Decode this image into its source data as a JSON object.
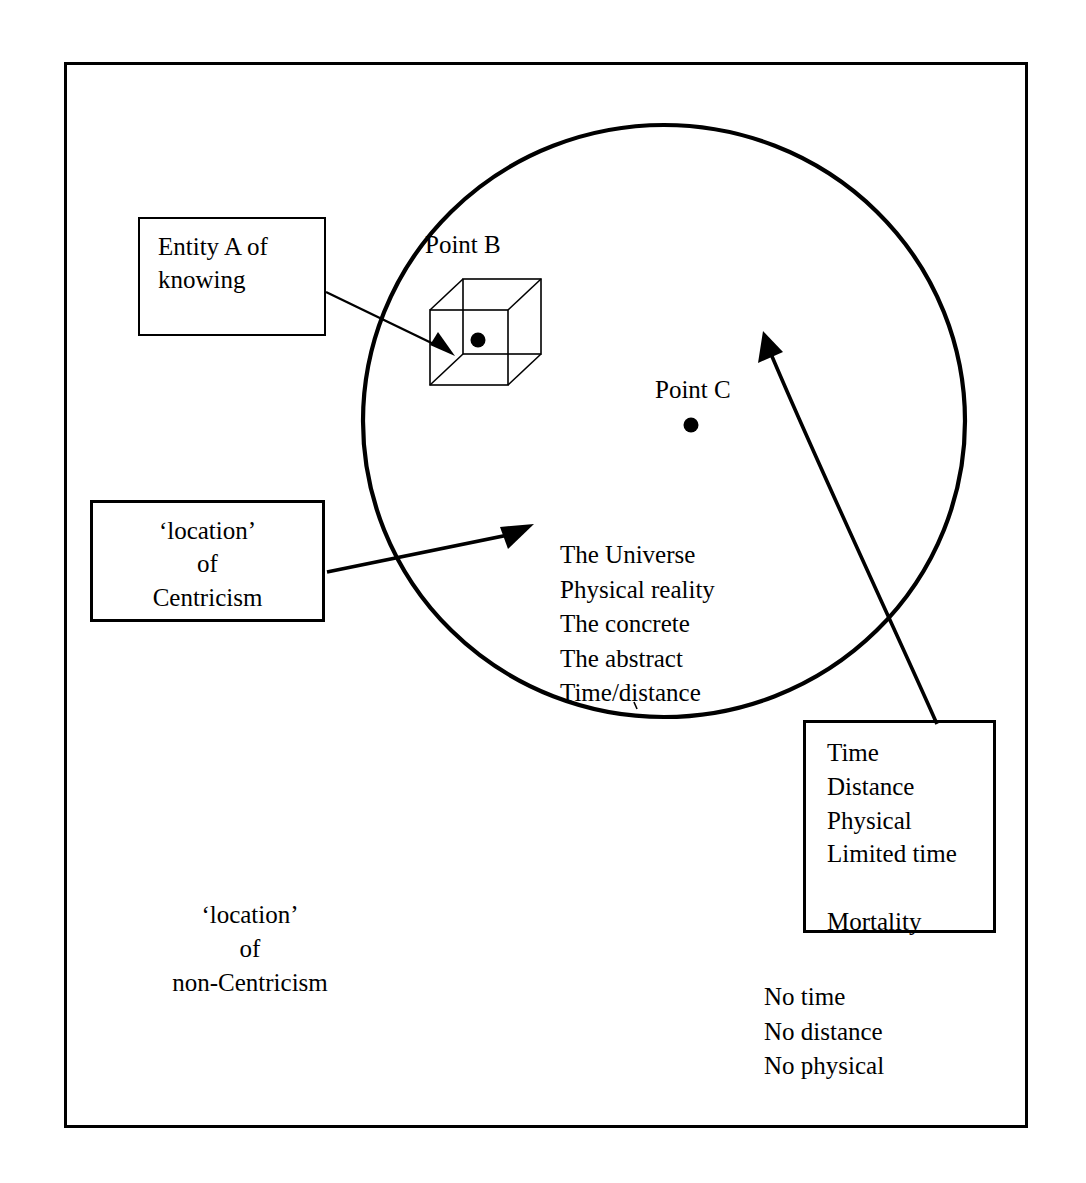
{
  "diagram": {
    "frame": {
      "stroke": "#000000",
      "width_px": 3
    },
    "circle": {
      "name": "universe-circle",
      "cx": 664,
      "cy": 421,
      "rx": 301,
      "ry": 296,
      "stroke": "#000000",
      "stroke_width": 4,
      "fill": "none"
    },
    "boxes": [
      {
        "id": "entity-a",
        "text": "Entity A of\nknowing",
        "align": "left",
        "border_width": 2
      },
      {
        "id": "centricism",
        "text": "‘location’\nof\nCentricism",
        "align": "center",
        "border_width": 3
      },
      {
        "id": "attributes",
        "text": "Time\nDistance\nPhysical\nLimited time\n\nMortality",
        "align": "left",
        "border_width": 3
      }
    ],
    "labels": {
      "point_b": "Point B",
      "point_c": "Point C",
      "inside_circle_list": "The Universe\nPhysical reality\nThe concrete\nThe abstract\nTime/distance",
      "non_centricism": "‘location’\nof\nnon-Centricism",
      "outside_list": "No time\nNo distance\nNo physical"
    },
    "points": [
      {
        "name": "point-b-dot",
        "label": "Point B",
        "cx": 478,
        "cy": 340,
        "r": 7
      },
      {
        "name": "point-c-dot",
        "label": "Point C",
        "cx": 691,
        "cy": 425,
        "r": 7
      }
    ],
    "cube": {
      "name": "wireframe-cube-point-b",
      "front": {
        "x": 430,
        "y": 310,
        "w": 78,
        "h": 75
      },
      "depth_dx": 33,
      "depth_dy": -31,
      "stroke": "#000000",
      "stroke_width": 1.5
    },
    "arrows": [
      {
        "name": "arrow-entity-a-to-cube",
        "from": {
          "x": 326,
          "y": 292
        },
        "to": {
          "x": 451,
          "y": 352
        },
        "head": "solid-triangle",
        "stroke_width": 2.5
      },
      {
        "name": "arrow-centricism-to-circle",
        "from": {
          "x": 327,
          "y": 570
        },
        "to": {
          "x": 531,
          "y": 528
        },
        "head": "solid-triangle",
        "stroke_width": 3.5
      },
      {
        "name": "arrow-attributes-to-circle-interior",
        "from": {
          "x": 935,
          "y": 723
        },
        "to": {
          "x": 762,
          "y": 338
        },
        "head": "solid-triangle",
        "stroke_width": 3.5
      }
    ],
    "colors": {
      "ink": "#000000",
      "paper": "#ffffff"
    }
  }
}
